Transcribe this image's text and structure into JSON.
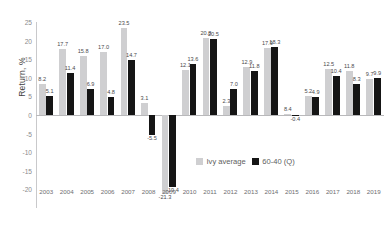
{
  "chart_data": {
    "type": "bar",
    "title": "",
    "xlabel": "",
    "ylabel": "Return, %",
    "ylim": [
      -25,
      25
    ],
    "yticks": [
      25,
      20,
      15,
      10,
      5,
      0,
      -5,
      -10,
      -15,
      -20
    ],
    "grid": false,
    "legend_position": "bottom-right",
    "categories": [
      "2003",
      "2004",
      "2005",
      "2006",
      "2007",
      "2008",
      "2009",
      "2010",
      "2011",
      "2012",
      "2013",
      "2014",
      "2015",
      "2016",
      "2017",
      "2018",
      "2019"
    ],
    "series": [
      {
        "name": "Ivy average",
        "color": "#cfcfd1",
        "values": [
          8.2,
          17.7,
          15.8,
          17.0,
          23.5,
          3.1,
          -21.3,
          12.1,
          20.8,
          2.3,
          12.9,
          17.9,
          0.4,
          5.2,
          12.5,
          11.8,
          9.7
        ]
      },
      {
        "name": "60-40 (Q)",
        "color": "#151515",
        "values": [
          5.1,
          11.4,
          6.9,
          4.8,
          14.7,
          -5.5,
          -19.4,
          13.6,
          20.5,
          7.0,
          11.8,
          18.3,
          -0.4,
          4.9,
          10.4,
          8.3,
          9.9
        ]
      }
    ],
    "labels": {
      "Ivy average": [
        "8.2",
        "17.7",
        "15.8",
        "17.0",
        "23.5",
        "3.1",
        "-21.3",
        "12.1",
        "20.8",
        "2.3",
        "12.9",
        "17.9",
        "8.4",
        "5.2",
        "12.5",
        "11.8",
        "9.7"
      ],
      "60-40 (Q)": [
        "5.1",
        "11.4",
        "6.9",
        "4.8",
        "14.7",
        "-5.5",
        "-19.4",
        "13.6",
        "20.5",
        "7.0",
        "11.8",
        "18.3",
        "-0.4",
        "4.9",
        "10.4",
        "8.3",
        "9.9"
      ]
    }
  },
  "legend": {
    "items": [
      {
        "label": "Ivy average",
        "swatch": "sw-a"
      },
      {
        "label": "60-40 (Q)",
        "swatch": "sw-b"
      }
    ]
  }
}
